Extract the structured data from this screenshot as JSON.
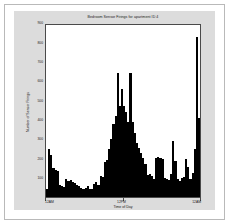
{
  "figure": {
    "background_color": "#dcdcdc",
    "axes_background_color": "#ffffff",
    "axes_edge_color": "#4a4a4a",
    "bar_color": "#000000",
    "page_border_color": "#b9b9b9"
  },
  "chart_data": {
    "type": "bar",
    "title": "Bedroom Sensor Firings for apartment ID 4",
    "xlabel": "Time of Day",
    "ylabel": "Number of Sensor Firings",
    "ylim": [
      0,
      900
    ],
    "grid": false,
    "legend": null,
    "ytick_labels": [
      "100",
      "200",
      "300",
      "400",
      "500",
      "600",
      "700",
      "800",
      "900"
    ],
    "ytick_values": [
      100,
      200,
      300,
      400,
      500,
      600,
      700,
      800,
      900
    ],
    "xtick_labels": [
      "12AM",
      "12PM",
      "12AM"
    ],
    "xtick_values": [
      0,
      36,
      72
    ],
    "bin_minutes": 20,
    "n_bins": 72,
    "values": [
      40,
      250,
      215,
      150,
      140,
      135,
      60,
      55,
      50,
      95,
      85,
      90,
      80,
      75,
      60,
      55,
      45,
      40,
      45,
      55,
      40,
      40,
      65,
      80,
      60,
      110,
      105,
      180,
      190,
      250,
      300,
      380,
      420,
      640,
      470,
      560,
      470,
      440,
      390,
      640,
      390,
      330,
      280,
      255,
      230,
      200,
      170,
      115,
      120,
      110,
      95,
      200,
      205,
      200,
      195,
      100,
      95,
      90,
      120,
      290,
      185,
      95,
      85,
      100,
      105,
      195,
      155,
      95,
      125,
      250,
      830,
      410
    ]
  }
}
